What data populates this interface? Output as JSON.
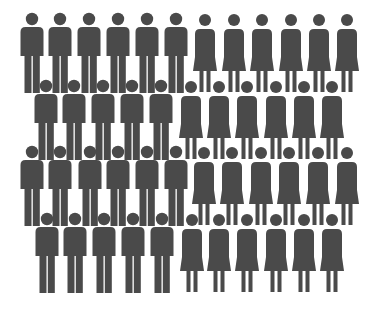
{
  "pictogram": {
    "description": "Crowd pictogram of men and women silhouettes",
    "color": "#4a4a4a",
    "background": "#ffffff",
    "total_figures": 46,
    "men_count": 22,
    "women_count": 24,
    "rows": [
      {
        "row": 1,
        "head_y": 19,
        "men_x": [
          32,
          60,
          89,
          118,
          147,
          176
        ],
        "women_x": [
          205,
          234,
          262,
          291,
          319,
          347
        ]
      },
      {
        "row": 2,
        "head_y": 86,
        "men_x": [
          46,
          74,
          103,
          132,
          161
        ],
        "women_x": [
          191,
          219,
          247,
          276,
          304,
          332
        ]
      },
      {
        "row": 3,
        "head_y": 152,
        "men_x": [
          32,
          60,
          90,
          118,
          147,
          176
        ],
        "women_x": [
          204,
          232,
          261,
          289,
          318,
          347
        ]
      },
      {
        "row": 4,
        "head_y": 219,
        "men_x": [
          47,
          75,
          104,
          133,
          162
        ],
        "women_x": [
          192,
          219,
          247,
          276,
          304,
          332
        ]
      }
    ]
  }
}
